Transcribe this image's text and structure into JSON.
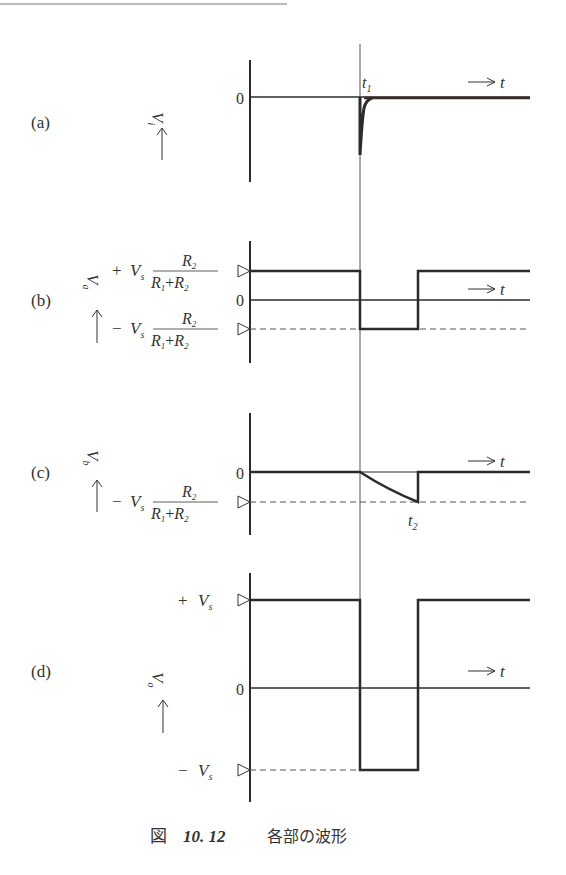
{
  "figure": {
    "caption_prefix": "図",
    "caption_number": "10. 12",
    "caption_text": "各部の波形"
  },
  "panels": [
    {
      "id": "a",
      "label": "(a)",
      "ylabel": "V",
      "ylabel_sub": "i",
      "zero_label": "0",
      "time_label": "t",
      "marker_label": "t",
      "marker_sub": "1"
    },
    {
      "id": "b",
      "label": "(b)",
      "ylabel": "V",
      "ylabel_sub": "a",
      "zero_label": "0",
      "time_label": "t",
      "pos_level": {
        "sign": "+",
        "v": "V",
        "vsub": "s",
        "num": "R",
        "num_sub": "2",
        "den1": "R",
        "den1_sub": "1",
        "plus": "+",
        "den2": "R",
        "den2_sub": "2"
      },
      "neg_level": {
        "sign": "−",
        "v": "V",
        "vsub": "s",
        "num": "R",
        "num_sub": "2",
        "den1": "R",
        "den1_sub": "1",
        "plus": "+",
        "den2": "R",
        "den2_sub": "2"
      }
    },
    {
      "id": "c",
      "label": "(c)",
      "ylabel": "V",
      "ylabel_sub": "b",
      "zero_label": "0",
      "time_label": "t",
      "marker_label": "t",
      "marker_sub": "2",
      "neg_level": {
        "sign": "−",
        "v": "V",
        "vsub": "s",
        "num": "R",
        "num_sub": "2",
        "den1": "R",
        "den1_sub": "1",
        "plus": "+",
        "den2": "R",
        "den2_sub": "2"
      }
    },
    {
      "id": "d",
      "label": "(d)",
      "ylabel": "V",
      "ylabel_sub": "o",
      "zero_label": "0",
      "time_label": "t",
      "pos_level": {
        "sign": "+",
        "v": "V",
        "vsub": "s"
      },
      "neg_level": {
        "sign": "−",
        "v": "V",
        "vsub": "s"
      }
    }
  ],
  "colors": {
    "ink": "#2b2b2b",
    "thin": "#444444"
  }
}
